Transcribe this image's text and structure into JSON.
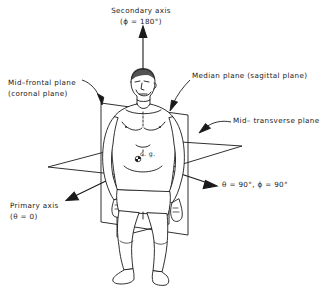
{
  "figure": {
    "background_color": "#ffffff",
    "line_color": "#1a1a1a",
    "text_color": "#1a1a1a"
  },
  "labels": {
    "secondary_axis": {
      "line1": "Secondary axis",
      "line2": "(ϕ = 180°)"
    },
    "mid_frontal_plane": {
      "line1": "Mid–frontal plane",
      "line2": "(coronal plane)"
    },
    "median_plane": {
      "line1": "Median plane (sagittal plane)"
    },
    "mid_transverse_plane": {
      "line1": "Mid– transverse plane"
    },
    "primary_axis": {
      "line1": "Primary axis",
      "line2": "(θ = 0)"
    },
    "lateral_axis": {
      "line1": "θ = 90°, ϕ = 90°"
    },
    "center_of_gravity": {
      "line1": "c. g."
    }
  },
  "annotations": {
    "angles": {
      "secondary_axis_phi": "180°",
      "primary_axis_theta": "0",
      "lateral_axis_theta": "90°",
      "lateral_axis_phi": "90°"
    }
  }
}
